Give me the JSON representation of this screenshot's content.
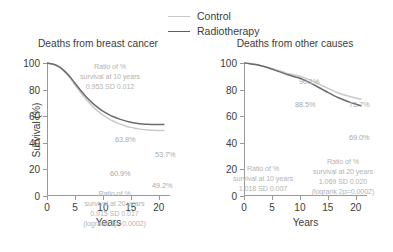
{
  "legend": {
    "entries": [
      {
        "label": "Control",
        "color": "#c6c6c6"
      },
      {
        "label": "Radiotherapy",
        "color": "#5e5e5e"
      }
    ]
  },
  "chart_data": [
    {
      "type": "line",
      "title": "Deaths from breast cancer",
      "xlabel": "Years",
      "ylabel": "Survival (%)",
      "xlim": [
        0,
        22
      ],
      "ylim": [
        0,
        100
      ],
      "xticks": [
        "0",
        "5",
        "10",
        "15",
        "20"
      ],
      "yticks": [
        "0",
        "20",
        "40",
        "60",
        "80",
        "100"
      ],
      "grid": false,
      "legend_position": "above",
      "x": [
        0,
        1,
        2,
        3,
        4,
        5,
        6,
        7,
        8,
        9,
        10,
        11,
        12,
        13,
        14,
        15,
        16,
        17,
        18,
        19,
        20,
        21
      ],
      "series": [
        {
          "name": "Radiotherapy",
          "color": "#6b6b6b",
          "values": [
            100,
            99.3,
            97.6,
            94.5,
            90.2,
            84.8,
            79.5,
            74.6,
            70.4,
            66.8,
            63.8,
            61.4,
            59.4,
            57.8,
            56.5,
            55.4,
            54.7,
            54.2,
            53.9,
            53.8,
            53.7,
            53.7
          ]
        },
        {
          "name": "Control",
          "color": "#c9c9c9",
          "values": [
            100,
            99.2,
            97.3,
            94.0,
            89.4,
            83.6,
            77.9,
            72.7,
            68.1,
            64.2,
            60.9,
            58.2,
            56.0,
            54.2,
            52.8,
            51.6,
            50.8,
            50.1,
            49.7,
            49.4,
            49.2,
            49.2
          ]
        }
      ],
      "point_labels": [
        {
          "text": "63.8%",
          "series": "Radiotherapy",
          "year": 10
        },
        {
          "text": "60.9%",
          "series": "Control",
          "year": 10
        },
        {
          "text": "53.7%",
          "series": "Radiotherapy",
          "year": 20
        },
        {
          "text": "49.2%",
          "series": "Control",
          "year": 20
        }
      ],
      "annotations": [
        {
          "id": "ratio-10yr",
          "lines": [
            "Ratio of %",
            "survival at 10 years",
            "0.953 SD 0.012"
          ]
        },
        {
          "id": "ratio-20yr",
          "lines": [
            "Ratio of %",
            "survival at 20 years",
            "0.915 SD 0.017",
            "(logrank 2p=0.0002)"
          ]
        }
      ]
    },
    {
      "type": "line",
      "title": "Deaths from other causes",
      "xlabel": "Years",
      "ylabel": "",
      "xlim": [
        0,
        22
      ],
      "ylim": [
        0,
        100
      ],
      "xticks": [
        "0",
        "5",
        "10",
        "15",
        "20"
      ],
      "yticks": [
        "0",
        "20",
        "40",
        "60",
        "80",
        "100"
      ],
      "grid": false,
      "legend_position": "above",
      "x": [
        0,
        1,
        2,
        3,
        4,
        5,
        6,
        7,
        8,
        9,
        10,
        11,
        12,
        13,
        14,
        15,
        16,
        17,
        18,
        19,
        20,
        21
      ],
      "series": [
        {
          "name": "Control",
          "color": "#c9c9c9",
          "values": [
            100,
            99.6,
            99.0,
            98.2,
            97.1,
            95.9,
            94.5,
            93.2,
            91.9,
            91.0,
            90.1,
            88.6,
            86.9,
            85.0,
            83.0,
            81.0,
            79.0,
            77.3,
            75.9,
            74.7,
            73.7,
            72.8
          ]
        },
        {
          "name": "Radiotherapy",
          "color": "#6b6b6b",
          "values": [
            100,
            99.5,
            98.8,
            97.9,
            96.8,
            95.4,
            93.9,
            92.4,
            91.0,
            89.7,
            88.5,
            86.7,
            84.7,
            82.5,
            80.2,
            77.9,
            75.7,
            73.7,
            72.0,
            70.4,
            69.0,
            67.8
          ]
        }
      ],
      "point_labels": [
        {
          "text": "90.1%",
          "series": "Control",
          "year": 10
        },
        {
          "text": "88.5%",
          "series": "Radiotherapy",
          "year": 10
        },
        {
          "text": "73.7%",
          "series": "Control",
          "year": 20
        },
        {
          "text": "69.0%",
          "series": "Radiotherapy",
          "year": 20
        }
      ],
      "annotations": [
        {
          "id": "ratio-10yr",
          "lines": [
            "Ratio of %",
            "survival at 10 years",
            "1.018 SD 0.007"
          ]
        },
        {
          "id": "ratio-20yr",
          "lines": [
            "Ratio of %",
            "survival at 20 years",
            "1.069 SD 0.020",
            "(logrank 2p=0.0002)"
          ]
        }
      ]
    }
  ]
}
